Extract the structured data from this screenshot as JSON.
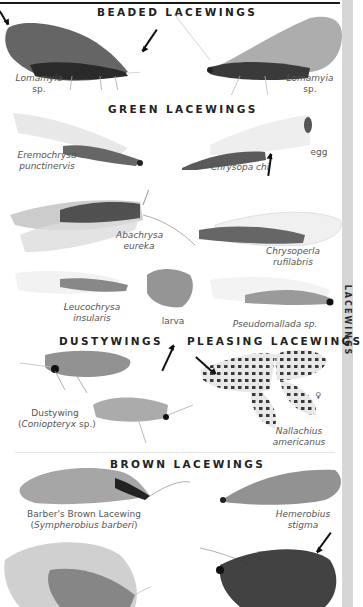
{
  "side_tab": {
    "label": "LACEWINGS",
    "color": "#d6d6d6"
  },
  "sections": {
    "beaded": {
      "heading": "BEADED LACEWINGS",
      "specimens": [
        {
          "name": "Lomamyia",
          "suffix": "sp."
        },
        {
          "name": "Lomamyia",
          "suffix": "sp."
        }
      ]
    },
    "green": {
      "heading": "GREEN LACEWINGS",
      "specimens": [
        {
          "line1": "Eremochrysa",
          "line2": "punctinervis"
        },
        {
          "line1": "Chrysopa chi"
        },
        {
          "line1": "egg"
        },
        {
          "line1": "Abachrysa",
          "line2": "eureka"
        },
        {
          "line1": "Chrysoperla",
          "line2": "rufilabris"
        },
        {
          "line1": "Leucochrysa",
          "line2": "insularis"
        },
        {
          "line1": "larva"
        },
        {
          "line1": "Pseudomallada sp."
        }
      ]
    },
    "dusty": {
      "heading": "DUSTYWINGS",
      "specimens": [
        {
          "line1": "Dustywing",
          "line2_open": "(",
          "line2_italic": "Coniopteryx",
          "line2_close": " sp.)"
        }
      ]
    },
    "pleasing": {
      "heading": "PLEASING LACEWINGS",
      "specimens": [
        {
          "line1": "Nallachius",
          "line2": "americanus",
          "sex": "♀"
        }
      ]
    },
    "brown": {
      "heading": "BROWN LACEWINGS",
      "specimens": [
        {
          "line1": "Barber's Brown Lacewing",
          "line2_open": "(",
          "line2_italic": "Sympherobius barberi",
          "line2_close": ")"
        },
        {
          "line1": "Hemerobius",
          "line2": "stigma"
        }
      ]
    }
  }
}
